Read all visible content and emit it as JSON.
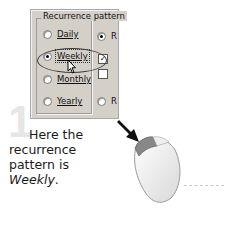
{
  "dialog": {
    "group_title": "Recurrence pattern",
    "options": [
      {
        "label": "Daily",
        "selected": false
      },
      {
        "label": "Weekly",
        "selected": true
      },
      {
        "label": "Monthly",
        "selected": false
      },
      {
        "label": "Yearly",
        "selected": false
      }
    ],
    "right_column": {
      "radio_top_label": "R",
      "radio_bottom_label": "R",
      "checkbox_checked_mark": "✓"
    }
  },
  "step": {
    "number": "1",
    "caption_line1": "Here the",
    "caption_line2": "recurrence",
    "caption_line3_prefix": "pattern is ",
    "caption_emphasis": "Weekly",
    "caption_suffix": "."
  },
  "icons": {
    "cursor": "arrow-cursor",
    "mouse": "mouse-left-click",
    "arrow": "black-arrow"
  }
}
